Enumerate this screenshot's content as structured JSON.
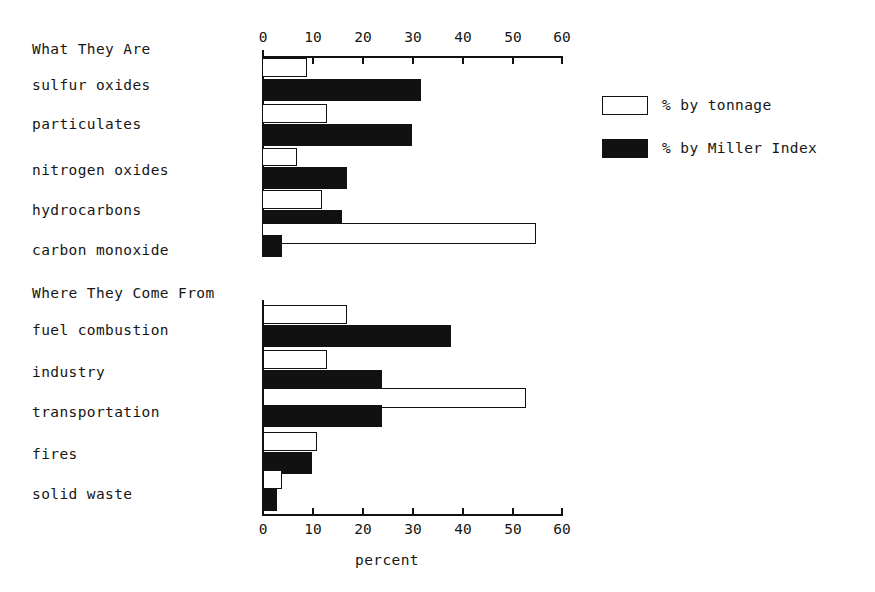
{
  "chart_data": {
    "type": "bar",
    "orientation": "horizontal",
    "title": "",
    "xlabel": "percent",
    "ylabel": "",
    "xlim": [
      0,
      60
    ],
    "xticks": [
      0,
      10,
      20,
      30,
      40,
      50,
      60
    ],
    "grid": false,
    "legend_position": "right",
    "legend": [
      "% by tonnage",
      "% by Miller Index"
    ],
    "panels": [
      {
        "title": "What They Are",
        "categories": [
          "sulfur oxides",
          "particulates",
          "nitrogen oxides",
          "hydrocarbons",
          "carbon monoxide"
        ],
        "series": [
          {
            "name": "% by tonnage",
            "values": [
              9,
              13,
              7,
              12,
              55
            ]
          },
          {
            "name": "% by Miller Index",
            "values": [
              32,
              30,
              17,
              16,
              4
            ]
          }
        ]
      },
      {
        "title": "Where They Come From",
        "categories": [
          "fuel combustion",
          "industry",
          "transportation",
          "fires",
          "solid waste"
        ],
        "series": [
          {
            "name": "% by tonnage",
            "values": [
              17,
              13,
              53,
              11,
              4
            ]
          },
          {
            "name": "% by Miller Index",
            "values": [
              38,
              24,
              24,
              10,
              3
            ]
          }
        ]
      }
    ]
  },
  "axis": {
    "top_ticks": [
      "0",
      "10",
      "20",
      "30",
      "40",
      "50",
      "60"
    ],
    "bottom_ticks": [
      "0",
      "10",
      "20",
      "30",
      "40",
      "50",
      "60"
    ],
    "xlabel": "percent"
  },
  "panel_top": {
    "title": "What They Are",
    "labels": [
      "sulfur oxides",
      "particulates",
      "nitrogen oxides",
      "hydrocarbons",
      "carbon monoxide"
    ]
  },
  "panel_bottom": {
    "title": "Where They Come From",
    "labels": [
      "fuel combustion",
      "industry",
      "transportation",
      "fires",
      "solid waste"
    ]
  },
  "legend": {
    "tonnage_label": "% by tonnage",
    "miller_label": "% by Miller Index"
  },
  "colors": {
    "tonnage": "#ffffff",
    "miller": "#111111",
    "axis": "#111111",
    "text": "#161616",
    "background": "#ffffff"
  }
}
